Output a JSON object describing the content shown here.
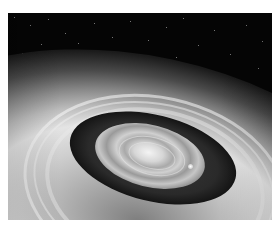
{
  "image": {
    "description": "Grayscale illustration of a ringed circumstellar disk with concentric bright bands, a dark gap, a bright central disk, and a small bright planet, against a starry black sky",
    "subject": "circumstellar-disk",
    "colors": {
      "sky": "#050505",
      "rings_bright": "#e4e4e4",
      "gap_dark": "#151515",
      "center": "#f4f4f4",
      "border": "#ffffff"
    }
  }
}
